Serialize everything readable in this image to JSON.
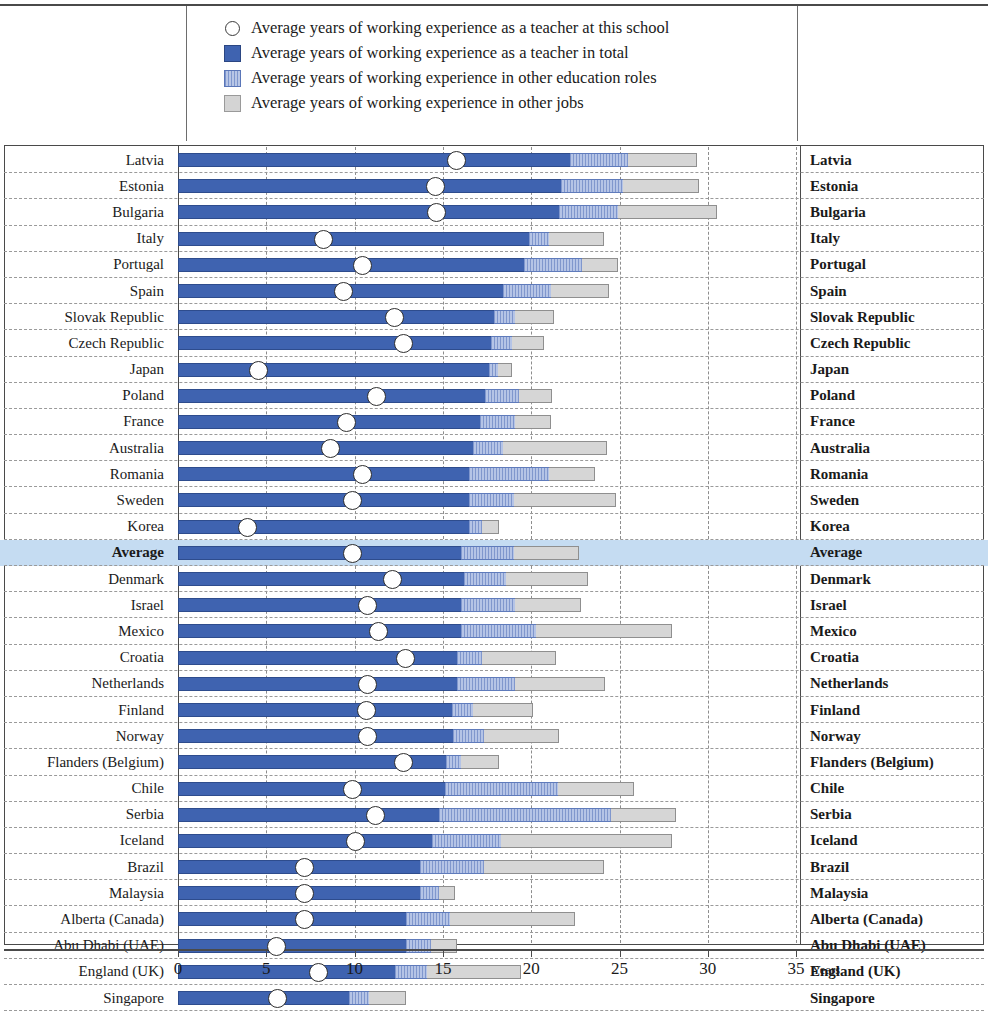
{
  "legend": {
    "items": [
      {
        "marker": "circle-outline-icon",
        "label": "Average years of working experience as a teacher at this school"
      },
      {
        "marker": "solid-blue-swatch-icon",
        "label": "Average years of working experience as a teacher in total"
      },
      {
        "marker": "hatched-blue-swatch-icon",
        "label": "Average years of working experience in other education roles"
      },
      {
        "marker": "grey-swatch-icon",
        "label": "Average years of working experience in other jobs"
      }
    ]
  },
  "axis": {
    "unit_label": "Years",
    "ticks": [
      "0",
      "5",
      "10",
      "15",
      "20",
      "25",
      "30",
      "35"
    ],
    "min": 0,
    "max": 35
  },
  "colors": {
    "teacher_total": "#3f63b0",
    "other_education_roles": "#93a9d8",
    "other_jobs": "#d6d6d6",
    "marker": "#ffffff",
    "average_row_highlight": "#c5dcf2"
  },
  "chart_data": {
    "type": "bar",
    "orientation": "horizontal",
    "stacked": true,
    "title": "",
    "xlabel": "Years",
    "ylabel": "",
    "xlim": [
      0,
      35
    ],
    "grid": "vertical-dashed-every-5",
    "legend_position": "top",
    "series": [
      {
        "name": "Average years of working experience as a teacher in total",
        "key": "teacher_total"
      },
      {
        "name": "Average years of working experience in other education roles",
        "key": "other_education_roles"
      },
      {
        "name": "Average years of working experience in other jobs",
        "key": "other_jobs"
      },
      {
        "name": "Average years of working experience as a teacher at this school",
        "key": "at_this_school",
        "render": "marker"
      }
    ],
    "categories": [
      "Latvia",
      "Estonia",
      "Bulgaria",
      "Italy",
      "Portugal",
      "Spain",
      "Slovak Republic",
      "Czech Republic",
      "Japan",
      "Poland",
      "France",
      "Australia",
      "Romania",
      "Sweden",
      "Korea",
      "Average",
      "Denmark",
      "Israel",
      "Mexico",
      "Croatia",
      "Netherlands",
      "Finland",
      "Norway",
      "Flanders (Belgium)",
      "Chile",
      "Serbia",
      "Iceland",
      "Brazil",
      "Malaysia",
      "Alberta (Canada)",
      "Abu Dhabi (UAE)",
      "England (UK)",
      "Singapore"
    ],
    "rows": [
      {
        "country": "Latvia",
        "teacher_total": 22.2,
        "other_education_roles": 3.3,
        "other_jobs": 3.9,
        "at_this_school": 15.7,
        "highlight": false
      },
      {
        "country": "Estonia",
        "teacher_total": 21.7,
        "other_education_roles": 3.5,
        "other_jobs": 4.3,
        "at_this_school": 14.5,
        "highlight": false
      },
      {
        "country": "Bulgaria",
        "teacher_total": 21.6,
        "other_education_roles": 3.3,
        "other_jobs": 5.6,
        "at_this_school": 14.6,
        "highlight": false
      },
      {
        "country": "Italy",
        "teacher_total": 19.9,
        "other_education_roles": 1.1,
        "other_jobs": 3.1,
        "at_this_school": 8.2,
        "highlight": false
      },
      {
        "country": "Portugal",
        "teacher_total": 19.6,
        "other_education_roles": 3.3,
        "other_jobs": 2.0,
        "at_this_school": 10.4,
        "highlight": false
      },
      {
        "country": "Spain",
        "teacher_total": 18.4,
        "other_education_roles": 2.7,
        "other_jobs": 3.3,
        "at_this_school": 9.3,
        "highlight": false
      },
      {
        "country": "Slovak Republic",
        "teacher_total": 17.9,
        "other_education_roles": 1.2,
        "other_jobs": 2.2,
        "at_this_school": 12.2,
        "highlight": false
      },
      {
        "country": "Czech Republic",
        "teacher_total": 17.7,
        "other_education_roles": 1.2,
        "other_jobs": 1.8,
        "at_this_school": 12.7,
        "highlight": false
      },
      {
        "country": "Japan",
        "teacher_total": 17.6,
        "other_education_roles": 0.5,
        "other_jobs": 0.8,
        "at_this_school": 4.5,
        "highlight": false
      },
      {
        "country": "Poland",
        "teacher_total": 17.4,
        "other_education_roles": 1.9,
        "other_jobs": 1.9,
        "at_this_school": 11.2,
        "highlight": false
      },
      {
        "country": "France",
        "teacher_total": 17.1,
        "other_education_roles": 2.0,
        "other_jobs": 2.0,
        "at_this_school": 9.5,
        "highlight": false
      },
      {
        "country": "Australia",
        "teacher_total": 16.7,
        "other_education_roles": 1.7,
        "other_jobs": 5.9,
        "at_this_school": 8.6,
        "highlight": false
      },
      {
        "country": "Romania",
        "teacher_total": 16.5,
        "other_education_roles": 4.5,
        "other_jobs": 2.6,
        "at_this_school": 10.4,
        "highlight": false
      },
      {
        "country": "Sweden",
        "teacher_total": 16.5,
        "other_education_roles": 2.5,
        "other_jobs": 5.8,
        "at_this_school": 9.8,
        "highlight": false
      },
      {
        "country": "Korea",
        "teacher_total": 16.5,
        "other_education_roles": 0.7,
        "other_jobs": 1.0,
        "at_this_school": 3.9,
        "highlight": false
      },
      {
        "country": "Average",
        "teacher_total": 16.0,
        "other_education_roles": 3.0,
        "other_jobs": 3.7,
        "at_this_school": 9.8,
        "highlight": true
      },
      {
        "country": "Denmark",
        "teacher_total": 16.2,
        "other_education_roles": 2.4,
        "other_jobs": 4.6,
        "at_this_school": 12.1,
        "highlight": false
      },
      {
        "country": "Israel",
        "teacher_total": 16.0,
        "other_education_roles": 3.1,
        "other_jobs": 3.7,
        "at_this_school": 10.7,
        "highlight": false
      },
      {
        "country": "Mexico",
        "teacher_total": 16.0,
        "other_education_roles": 4.3,
        "other_jobs": 7.7,
        "at_this_school": 11.3,
        "highlight": false
      },
      {
        "country": "Croatia",
        "teacher_total": 15.8,
        "other_education_roles": 1.4,
        "other_jobs": 4.2,
        "at_this_school": 12.8,
        "highlight": false
      },
      {
        "country": "Netherlands",
        "teacher_total": 15.8,
        "other_education_roles": 3.3,
        "other_jobs": 5.1,
        "at_this_school": 10.7,
        "highlight": false
      },
      {
        "country": "Finland",
        "teacher_total": 15.5,
        "other_education_roles": 1.2,
        "other_jobs": 3.4,
        "at_this_school": 10.6,
        "highlight": false
      },
      {
        "country": "Norway",
        "teacher_total": 15.6,
        "other_education_roles": 1.7,
        "other_jobs": 4.3,
        "at_this_school": 10.7,
        "highlight": false
      },
      {
        "country": "Flanders (Belgium)",
        "teacher_total": 15.2,
        "other_education_roles": 0.8,
        "other_jobs": 2.2,
        "at_this_school": 12.7,
        "highlight": false
      },
      {
        "country": "Chile",
        "teacher_total": 15.1,
        "other_education_roles": 6.4,
        "other_jobs": 4.3,
        "at_this_school": 9.8,
        "highlight": false
      },
      {
        "country": "Serbia",
        "teacher_total": 14.8,
        "other_education_roles": 9.7,
        "other_jobs": 3.7,
        "at_this_school": 11.1,
        "highlight": false
      },
      {
        "country": "Iceland",
        "teacher_total": 14.4,
        "other_education_roles": 3.9,
        "other_jobs": 9.7,
        "at_this_school": 10.0,
        "highlight": false
      },
      {
        "country": "Brazil",
        "teacher_total": 13.7,
        "other_education_roles": 3.6,
        "other_jobs": 6.8,
        "at_this_school": 7.1,
        "highlight": false
      },
      {
        "country": "Malaysia",
        "teacher_total": 13.7,
        "other_education_roles": 1.1,
        "other_jobs": 0.9,
        "at_this_school": 7.1,
        "highlight": false
      },
      {
        "country": "Alberta (Canada)",
        "teacher_total": 12.9,
        "other_education_roles": 2.5,
        "other_jobs": 7.1,
        "at_this_school": 7.1,
        "highlight": false
      },
      {
        "country": "Abu Dhabi (UAE)",
        "teacher_total": 12.9,
        "other_education_roles": 1.4,
        "other_jobs": 1.5,
        "at_this_school": 5.5,
        "highlight": false
      },
      {
        "country": "England (UK)",
        "teacher_total": 12.3,
        "other_education_roles": 1.8,
        "other_jobs": 5.3,
        "at_this_school": 7.9,
        "highlight": false
      },
      {
        "country": "Singapore",
        "teacher_total": 9.7,
        "other_education_roles": 1.1,
        "other_jobs": 2.1,
        "at_this_school": 5.6,
        "highlight": false
      }
    ]
  }
}
